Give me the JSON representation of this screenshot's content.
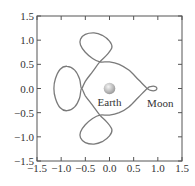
{
  "chart_data": {
    "type": "line",
    "title": "",
    "xlabel": "",
    "ylabel": "",
    "xlim": [
      -1.5,
      1.5
    ],
    "ylim": [
      -1.5,
      1.5
    ],
    "grid": false,
    "xticks": [
      -1.5,
      -1.0,
      -0.5,
      0.0,
      0.5,
      1.0,
      1.5
    ],
    "yticks": [
      -1.5,
      -1.0,
      -0.5,
      0.0,
      0.5,
      1.0,
      1.5
    ],
    "xtick_labels": [
      "−1.5",
      "−1.0",
      "−0.5",
      "0.0",
      "0.5",
      "1.0",
      "1.5"
    ],
    "ytick_labels": [
      "−1.5",
      "−1.0",
      "−0.5",
      "0.0",
      "0.5",
      "1.0",
      "1.5"
    ],
    "series": [
      {
        "name": "orbit",
        "color": "#7a7a7a",
        "points": [
          [
            0.78,
            0.0
          ],
          [
            0.6,
            0.18
          ],
          [
            0.4,
            0.38
          ],
          [
            0.2,
            0.5
          ],
          [
            0.0,
            0.55
          ],
          [
            -0.2,
            0.55
          ],
          [
            -0.35,
            0.62
          ],
          [
            -0.5,
            0.75
          ],
          [
            -0.6,
            0.9
          ],
          [
            -0.6,
            1.02
          ],
          [
            -0.5,
            1.12
          ],
          [
            -0.32,
            1.15
          ],
          [
            -0.15,
            1.1
          ],
          [
            0.0,
            0.98
          ],
          [
            0.05,
            0.85
          ],
          [
            -0.05,
            0.7
          ],
          [
            -0.2,
            0.55
          ],
          [
            -0.35,
            0.35
          ],
          [
            -0.5,
            0.15
          ],
          [
            -0.58,
            0.0
          ],
          [
            -0.62,
            0.2
          ],
          [
            -0.72,
            0.38
          ],
          [
            -0.88,
            0.46
          ],
          [
            -1.02,
            0.4
          ],
          [
            -1.12,
            0.2
          ],
          [
            -1.15,
            0.0
          ],
          [
            -1.12,
            -0.2
          ],
          [
            -1.02,
            -0.4
          ],
          [
            -0.88,
            -0.46
          ],
          [
            -0.72,
            -0.38
          ],
          [
            -0.62,
            -0.2
          ],
          [
            -0.58,
            0.0
          ],
          [
            -0.5,
            -0.15
          ],
          [
            -0.35,
            -0.35
          ],
          [
            -0.2,
            -0.55
          ],
          [
            -0.05,
            -0.7
          ],
          [
            0.05,
            -0.85
          ],
          [
            0.0,
            -0.98
          ],
          [
            -0.15,
            -1.1
          ],
          [
            -0.32,
            -1.15
          ],
          [
            -0.5,
            -1.12
          ],
          [
            -0.6,
            -1.02
          ],
          [
            -0.6,
            -0.9
          ],
          [
            -0.5,
            -0.75
          ],
          [
            -0.35,
            -0.62
          ],
          [
            -0.2,
            -0.55
          ],
          [
            0.0,
            -0.55
          ],
          [
            0.2,
            -0.5
          ],
          [
            0.4,
            -0.38
          ],
          [
            0.6,
            -0.18
          ],
          [
            0.78,
            0.0
          ],
          [
            0.85,
            0.04
          ],
          [
            0.95,
            0.04
          ],
          [
            0.98,
            0.0
          ],
          [
            0.95,
            -0.04
          ],
          [
            0.85,
            -0.04
          ],
          [
            0.78,
            0.0
          ]
        ]
      }
    ],
    "annotations": [
      {
        "text": "Earth",
        "x": 0.0,
        "y": -0.27
      },
      {
        "text": "Moon",
        "x": 1.05,
        "y": -0.3
      }
    ],
    "markers": [
      {
        "name": "Earth",
        "x": 0.0,
        "y": 0.0,
        "radius": 0.12
      }
    ]
  },
  "labels": {
    "earth": "Earth",
    "moon": "Moon"
  },
  "style": {
    "frame_color": "#555555",
    "curve_color": "#7a7a7a",
    "earth_fill_light": "#f2f2f2",
    "earth_fill_dark": "#9a9a9a"
  }
}
